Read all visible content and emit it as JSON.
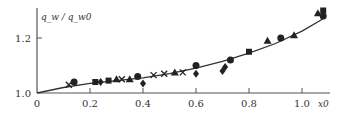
{
  "chart_data": {
    "type": "scatter",
    "title": "",
    "xlabel": "x0",
    "ylabel": "q_w / q_w0",
    "xlim": [
      0,
      1.1
    ],
    "ylim": [
      1.0,
      1.3
    ],
    "xticks": [
      "0",
      "0.2",
      "0.4",
      "0.6",
      "0.8",
      "1.0"
    ],
    "yticks": [
      "1.0",
      "1.2"
    ],
    "grid": false,
    "legend": null,
    "curve": {
      "name": "fit",
      "x": [
        0,
        0.1,
        0.2,
        0.3,
        0.4,
        0.5,
        0.6,
        0.7,
        0.8,
        0.9,
        1.0,
        1.08
      ],
      "y": [
        1.0,
        1.02,
        1.035,
        1.045,
        1.055,
        1.07,
        1.09,
        1.115,
        1.145,
        1.18,
        1.225,
        1.27
      ]
    },
    "series": [
      {
        "name": "circle",
        "marker": "circle",
        "points": [
          [
            0.14,
            1.04
          ],
          [
            0.38,
            1.06
          ],
          [
            0.6,
            1.1
          ],
          [
            0.73,
            1.12
          ],
          [
            0.92,
            1.2
          ],
          [
            1.08,
            1.28
          ]
        ]
      },
      {
        "name": "square",
        "marker": "square",
        "points": [
          [
            0.22,
            1.04
          ],
          [
            0.27,
            1.045
          ],
          [
            0.8,
            1.15
          ],
          [
            1.08,
            1.3
          ]
        ]
      },
      {
        "name": "triangle",
        "marker": "triangle",
        "points": [
          [
            0.3,
            1.05
          ],
          [
            0.35,
            1.05
          ],
          [
            0.52,
            1.075
          ],
          [
            0.87,
            1.19
          ],
          [
            0.97,
            1.21
          ],
          [
            1.06,
            1.29
          ]
        ]
      },
      {
        "name": "cross",
        "marker": "x",
        "points": [
          [
            0.12,
            1.03
          ],
          [
            0.32,
            1.05
          ],
          [
            0.44,
            1.065
          ],
          [
            0.48,
            1.07
          ],
          [
            0.55,
            1.075
          ]
        ]
      },
      {
        "name": "diamond",
        "marker": "diamond",
        "points": [
          [
            0.4,
            1.035
          ],
          [
            0.6,
            1.07
          ],
          [
            0.7,
            1.08
          ],
          [
            0.24,
            1.04
          ],
          [
            0.71,
            1.095
          ]
        ]
      }
    ]
  }
}
